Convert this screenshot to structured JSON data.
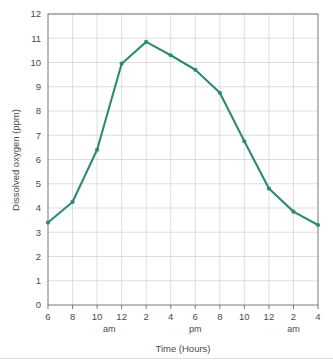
{
  "chart_data": {
    "type": "line",
    "title": "",
    "xlabel": "Time (Hours)",
    "ylabel": "Dissolved oxygen (ppm)",
    "x_tick_labels": [
      "6",
      "8",
      "10",
      "12",
      "2",
      "4",
      "6",
      "8",
      "10",
      "12",
      "2",
      "4"
    ],
    "x_meridiem_labels": [
      {
        "label": "am",
        "after_tick": "12"
      },
      {
        "label": "pm",
        "after_tick": "6"
      },
      {
        "label": "am",
        "after_tick": "2"
      }
    ],
    "y_tick_labels": [
      "0",
      "1",
      "2",
      "3",
      "4",
      "5",
      "6",
      "7",
      "8",
      "9",
      "10",
      "11",
      "12"
    ],
    "ylim": [
      0,
      12
    ],
    "xlim": [
      0,
      11
    ],
    "grid": true,
    "legend": false,
    "categories": [
      "6 am",
      "8 am",
      "10 am",
      "12 pm",
      "2 pm",
      "4 pm",
      "6 pm",
      "8 pm",
      "10 pm",
      "12 am",
      "2 am",
      "4 am"
    ],
    "values": [
      3.4,
      4.25,
      6.4,
      9.95,
      10.85,
      10.3,
      9.7,
      8.75,
      6.75,
      4.8,
      3.85,
      3.3
    ],
    "series": [
      {
        "name": "Dissolved oxygen",
        "color": "#2e8b72",
        "values": [
          3.4,
          4.25,
          6.4,
          9.95,
          10.85,
          10.3,
          9.7,
          8.75,
          6.75,
          4.8,
          3.85,
          3.3
        ]
      }
    ]
  },
  "colors": {
    "line": "#2e8b72",
    "grid": "#c9c9c9",
    "frame": "#6b6b6b",
    "text": "#4a4a4a",
    "background": "#ffffff"
  }
}
